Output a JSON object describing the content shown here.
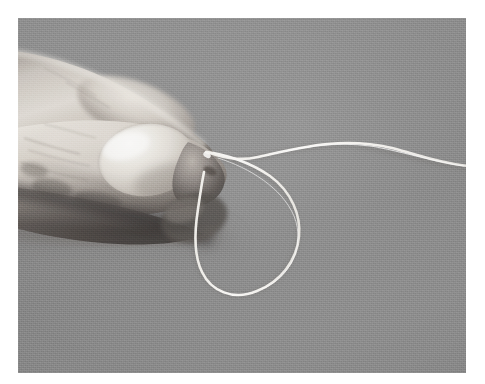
{
  "image": {
    "title": "Hand holding a loop of white thread",
    "medium": "black-and-white photograph",
    "caption": "",
    "alt_text": "A close-up black and white photograph of a left hand, seen from the side, with the index finger and thumb pinching a length of pale white string. The string runs off toward the right edge of the frame and doubles back on itself, forming a large open loop that hangs below and to the right of the pinched fingertips against a plain mid-grey background.",
    "frame": {
      "canvas_width": 485,
      "canvas_height": 384,
      "print_left": 18,
      "print_top": 18,
      "print_width": 448,
      "print_height": 355,
      "canvas_color": "#ffffff",
      "background_color": "#8b8b8b"
    },
    "palette": {
      "paper_white": "#ffffff",
      "background_grey": "#8b8b8b",
      "background_grey_light": "#9a9a9a",
      "background_grey_dark": "#7c7c7c",
      "skin_highlight": "#ededea",
      "skin_midtone": "#b9b3ad",
      "skin_shadow": "#6a645f",
      "skin_deep_shadow": "#3a3532",
      "nail_highlight": "#f4f2ee",
      "nail_midtone": "#d6d2cb",
      "string_white": "#f7f6f2",
      "string_core": "#ffffff"
    },
    "subjects": [
      {
        "name": "index-finger",
        "description": "index finger entering from the left edge, angled down-right, resting above the thumb"
      },
      {
        "name": "thumb",
        "description": "thumb with a large bright fingernail, tip pointing right, pinching the thread"
      },
      {
        "name": "thumbnail",
        "description": "broad oval fingernail catching a strong specular highlight"
      },
      {
        "name": "middle-finger",
        "description": "shadowed finger below the thumb, mostly in deep shadow"
      },
      {
        "name": "thread",
        "description": "thin pale string pinched between finger and thumb, trailing to the right edge and looping back"
      },
      {
        "name": "thread-loop",
        "description": "large open loop of thread hanging below and right of the fingertips"
      }
    ],
    "geometry": {
      "pinch_point": {
        "x": 207,
        "y": 152
      },
      "thread_right_exit": {
        "x": 466,
        "y": 166
      },
      "thread_arc_peak": {
        "x": 345,
        "y": 144
      },
      "loop_bottom": {
        "x": 252,
        "y": 289
      },
      "loop_right": {
        "x": 297,
        "y": 226
      },
      "loop_left": {
        "x": 200,
        "y": 244
      }
    }
  }
}
